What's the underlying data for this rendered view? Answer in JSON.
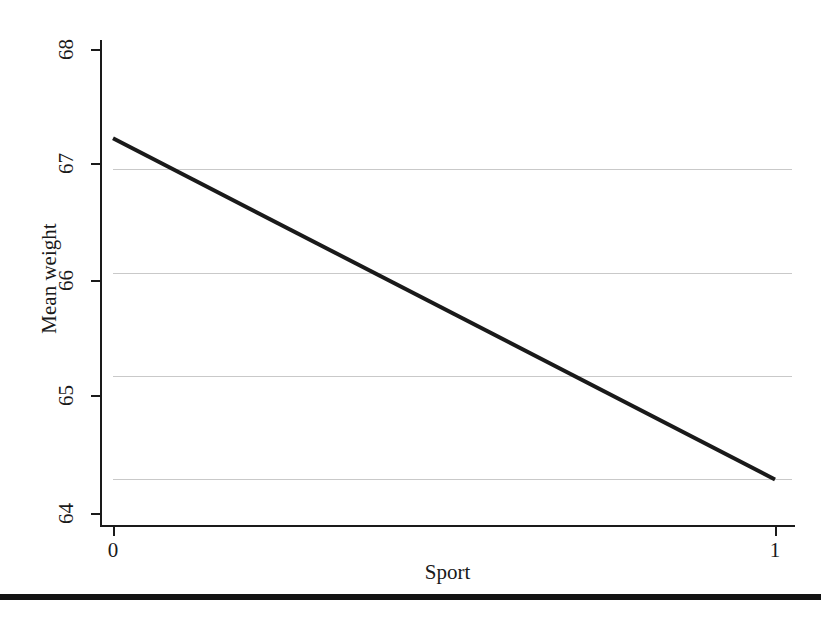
{
  "chart_data": {
    "type": "line",
    "title": "",
    "subtitle": "",
    "xlabel": "Sport",
    "ylabel": "Mean weight",
    "x": [
      0,
      1
    ],
    "series": [
      {
        "name": "Mean weight",
        "values": [
          67.3,
          64.0
        ],
        "color": "#1a1a1a",
        "linewidth": 4
      }
    ],
    "xlim": [
      0,
      1
    ],
    "ylim": [
      63.55,
      68.25
    ],
    "xticks": [
      0,
      1
    ],
    "xticklabels": [
      "0",
      "1"
    ],
    "yticks": [
      64,
      65,
      66,
      67,
      68
    ],
    "yticklabels": [
      "64",
      "65",
      "66",
      "67",
      "68"
    ],
    "gridlines": {
      "horizontal": [
        64,
        65,
        66,
        67
      ],
      "vertical": [],
      "color": "#c9c9c9",
      "on": true
    },
    "legend": {
      "visible": false,
      "position": "none",
      "entries": []
    },
    "annotations": [],
    "axis_line_color": "#1a1a1a",
    "background_color": "#ffffff"
  },
  "figure": {
    "bottom_rule_color": "#131313"
  }
}
